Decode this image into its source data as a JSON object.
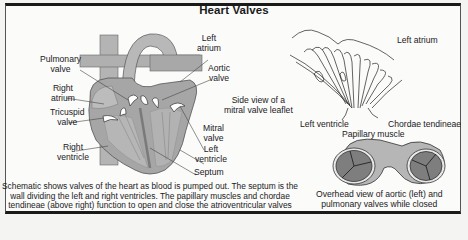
{
  "figure": {
    "title": "Heart Valves",
    "heart_schematic": {
      "labels": {
        "pulmonary_valve": [
          "Pulmonary",
          "valve"
        ],
        "right_atrium": [
          "Right",
          "atrium"
        ],
        "tricuspid_valve": [
          "Tricuspid",
          "valve"
        ],
        "right_ventricle": [
          "Right",
          "ventricle"
        ],
        "left_atrium": [
          "Left",
          "atrium"
        ],
        "aortic_valve": [
          "Aortic",
          "valve"
        ],
        "mitral_valve": [
          "Mitral",
          "valve"
        ],
        "left_ventricle": [
          "Left",
          "ventricle"
        ],
        "septum": "Septum"
      },
      "caption": [
        "Schematic shows valves of the heart as blood is pumped out. The septum is the",
        "wall dividing the left and right ventricles. The papillary muscles and chordae",
        "tendineae (above right) function to open and close the atrioventricular valves"
      ]
    },
    "mitral_side_view": {
      "caption": [
        "Side view of a",
        "mitral valve leaflet"
      ],
      "labels": {
        "left_atrium": "Left atrium",
        "left_ventricle": "Left ventricle",
        "chordae_tendineae": "Chordae tendineae",
        "papillary_muscle": "Papillary muscle"
      }
    },
    "overhead_view": {
      "caption": [
        "Overhead view of aortic (left) and",
        "pulmonary valves while closed"
      ]
    },
    "colors": {
      "tissue": "#a8a8a8",
      "tissue_light": "#c4c4c4",
      "tissue_dark": "#8a8a8a",
      "valve_fill": "#7a7a7a",
      "outline": "#3a3a3a",
      "border": "#1a1a1a"
    }
  }
}
